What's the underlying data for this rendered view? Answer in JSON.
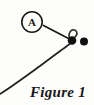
{
  "figure": {
    "caption": "Figure 1",
    "background_color": "#fdfdfc",
    "ink_color": "#1c1a18",
    "callouts": [
      {
        "id": "callout-a",
        "label": "A",
        "shape": "circled-letter",
        "center_x": 32,
        "center_y": 22,
        "radius": 10,
        "leader_line": {
          "from_x": 43,
          "from_y": 26,
          "to_x": 68,
          "to_y": 39
        }
      }
    ],
    "markers": [
      {
        "id": "open-ring",
        "type": "open-circle",
        "center_x": 73,
        "center_y": 31,
        "radius": 4.1,
        "filled": false
      },
      {
        "id": "filled-dot-left",
        "type": "filled-circle",
        "center_x": 72,
        "center_y": 40,
        "radius": 4.2,
        "filled": true
      },
      {
        "id": "filled-dot-right",
        "type": "filled-circle",
        "center_x": 84,
        "center_y": 41,
        "radius": 4.0,
        "filled": true
      }
    ],
    "curve": {
      "id": "sweeping-curve",
      "description": "arc sweeping from lower-left corner up to the right, looping around the marker cluster",
      "stroke_width": 1.6
    }
  }
}
